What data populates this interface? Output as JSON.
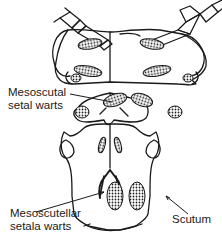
{
  "figure": {
    "stroke_color": "#1a1a1a",
    "background": "#ffffff"
  },
  "labels": {
    "mesoscutal": [
      "Mesoscutal",
      "setal warts"
    ],
    "mesoscutellar": [
      "Mesoscutellar",
      "setala warts"
    ],
    "scutum": "Scutum"
  }
}
